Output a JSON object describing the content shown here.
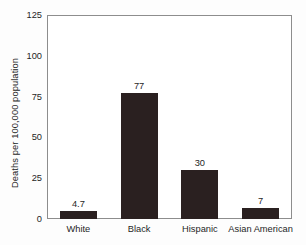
{
  "chart_data": {
    "type": "bar",
    "title": "",
    "subtitle": "",
    "xlabel": "",
    "ylabel": "Deaths per 100,000 population",
    "categories": [
      "White",
      "Black",
      "Hispanic",
      "Asian American"
    ],
    "values": [
      4.7,
      77,
      30,
      7
    ],
    "value_labels": [
      "4.7",
      "77",
      "30",
      "7"
    ],
    "ylim": [
      0,
      125
    ],
    "yticks": [
      0,
      25,
      50,
      75,
      100,
      125
    ],
    "ytick_labels": [
      "0",
      "25",
      "50",
      "75",
      "100",
      "125"
    ],
    "grid": false,
    "legend": false,
    "legend_position": "none",
    "bar_color": "#2a2020",
    "frame_color": "#8d8d8d",
    "background_color": "#ffffff"
  }
}
